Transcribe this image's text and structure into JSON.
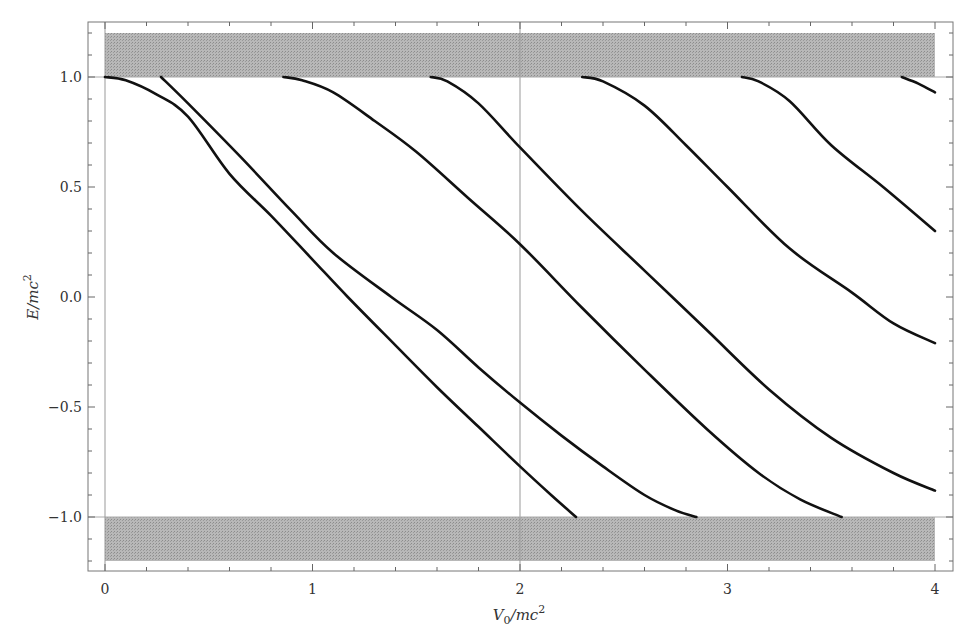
{
  "chart_data": {
    "type": "line",
    "title": "",
    "xlabel": "V0/mc^2",
    "ylabel": "E/mc^2",
    "xlim": [
      -0.08,
      4.09
    ],
    "ylim": [
      -1.25,
      1.25
    ],
    "grid": false,
    "x_ticks": [
      0,
      1,
      2,
      3,
      4
    ],
    "x_tick_labels": [
      "0",
      "1",
      "2",
      "3",
      "4"
    ],
    "y_ticks": [
      1.0,
      0.5,
      0.0,
      -0.5,
      -1.0
    ],
    "y_tick_labels": [
      "1.0",
      "0.5",
      "0.0",
      "-0.5",
      "-1.0"
    ],
    "reference_lines": {
      "vertical_x": 2,
      "horizontal_y": [
        1.0,
        -1.0
      ]
    },
    "shaded_bands": [
      {
        "name": "positive continuum",
        "x": [
          0,
          4
        ],
        "y": [
          1.0,
          1.2
        ],
        "color": "#a6a6a6"
      },
      {
        "name": "negative continuum",
        "x": [
          0,
          4
        ],
        "y": [
          -1.2,
          -1.0
        ],
        "color": "#a6a6a6"
      }
    ],
    "series": [
      {
        "name": "level 1",
        "points": [
          [
            0,
            1.0
          ],
          [
            0.1,
            0.985
          ],
          [
            0.25,
            0.92
          ],
          [
            0.4,
            0.82
          ],
          [
            0.6,
            0.56
          ],
          [
            0.8,
            0.37
          ],
          [
            1.0,
            0.17
          ],
          [
            1.17,
            0.0
          ],
          [
            1.4,
            -0.22
          ],
          [
            1.6,
            -0.41
          ],
          [
            1.8,
            -0.59
          ],
          [
            2.0,
            -0.77
          ],
          [
            2.15,
            -0.9
          ],
          [
            2.27,
            -1.0
          ]
        ]
      },
      {
        "name": "level 2",
        "points": [
          [
            0.27,
            1.0
          ],
          [
            0.4,
            0.88
          ],
          [
            0.65,
            0.64
          ],
          [
            0.9,
            0.39
          ],
          [
            1.1,
            0.2
          ],
          [
            1.38,
            0.0
          ],
          [
            1.6,
            -0.15
          ],
          [
            1.8,
            -0.32
          ],
          [
            2.0,
            -0.48
          ],
          [
            2.2,
            -0.63
          ],
          [
            2.4,
            -0.77
          ],
          [
            2.6,
            -0.9
          ],
          [
            2.75,
            -0.97
          ],
          [
            2.85,
            -1.0
          ]
        ]
      },
      {
        "name": "level 3",
        "points": [
          [
            0.86,
            1.0
          ],
          [
            0.95,
            0.985
          ],
          [
            1.1,
            0.93
          ],
          [
            1.3,
            0.8
          ],
          [
            1.5,
            0.66
          ],
          [
            1.75,
            0.45
          ],
          [
            2.0,
            0.24
          ],
          [
            2.3,
            -0.05
          ],
          [
            2.6,
            -0.33
          ],
          [
            2.9,
            -0.6
          ],
          [
            3.15,
            -0.8
          ],
          [
            3.35,
            -0.92
          ],
          [
            3.55,
            -1.0
          ]
        ]
      },
      {
        "name": "level 4",
        "points": [
          [
            1.57,
            1.0
          ],
          [
            1.65,
            0.98
          ],
          [
            1.8,
            0.88
          ],
          [
            2.0,
            0.68
          ],
          [
            2.3,
            0.39
          ],
          [
            2.6,
            0.12
          ],
          [
            2.9,
            -0.15
          ],
          [
            3.2,
            -0.42
          ],
          [
            3.5,
            -0.64
          ],
          [
            3.8,
            -0.8
          ],
          [
            4.0,
            -0.88
          ]
        ]
      },
      {
        "name": "level 5",
        "points": [
          [
            2.3,
            1.0
          ],
          [
            2.4,
            0.98
          ],
          [
            2.6,
            0.87
          ],
          [
            2.8,
            0.69
          ],
          [
            3.0,
            0.5
          ],
          [
            3.3,
            0.22
          ],
          [
            3.6,
            0.02
          ],
          [
            3.8,
            -0.12
          ],
          [
            4.0,
            -0.21
          ]
        ]
      },
      {
        "name": "level 6",
        "points": [
          [
            3.07,
            1.0
          ],
          [
            3.15,
            0.98
          ],
          [
            3.3,
            0.89
          ],
          [
            3.5,
            0.69
          ],
          [
            3.75,
            0.5
          ],
          [
            4.0,
            0.3
          ]
        ]
      },
      {
        "name": "level 7",
        "points": [
          [
            3.84,
            1.0
          ],
          [
            3.92,
            0.97
          ],
          [
            4.0,
            0.93
          ]
        ]
      }
    ]
  }
}
